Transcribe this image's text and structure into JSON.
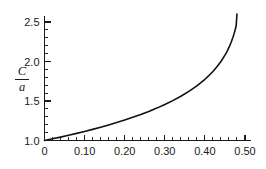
{
  "chart_data": {
    "type": "line",
    "title": "",
    "subtitle": "",
    "xlabel": "",
    "ylabel": "C/a",
    "ylabel_numerator": "C",
    "ylabel_denominator": "a",
    "xlim": [
      0,
      0.5
    ],
    "ylim": [
      1.0,
      2.6
    ],
    "grid": false,
    "legend": null,
    "legend_position": "none",
    "x_ticks_major": [
      0,
      0.1,
      0.2,
      0.3,
      0.4,
      0.5
    ],
    "x_tick_labels": [
      "0",
      "0.10",
      "0.20",
      "0.30",
      "0.40",
      "0.50"
    ],
    "x_tick_minor_step": 0.02,
    "y_ticks_major": [
      1.0,
      1.5,
      2.0,
      2.5
    ],
    "y_tick_labels": [
      "1.0",
      "1.5",
      "2.0",
      "2.5"
    ],
    "y_tick_minor_step": 0.1,
    "series": [
      {
        "name": "C/a",
        "color": "#111111",
        "x": [
          0.0,
          0.02,
          0.04,
          0.06,
          0.08,
          0.1,
          0.12,
          0.14,
          0.16,
          0.18,
          0.2,
          0.22,
          0.24,
          0.26,
          0.28,
          0.3,
          0.32,
          0.34,
          0.36,
          0.38,
          0.4,
          0.41,
          0.42,
          0.43,
          0.44,
          0.45,
          0.455,
          0.46,
          0.465,
          0.47,
          0.473,
          0.476,
          0.478,
          0.48
        ],
        "y": [
          1.0,
          1.021,
          1.043,
          1.066,
          1.09,
          1.115,
          1.141,
          1.168,
          1.197,
          1.227,
          1.259,
          1.293,
          1.329,
          1.368,
          1.41,
          1.455,
          1.505,
          1.56,
          1.622,
          1.692,
          1.775,
          1.822,
          1.874,
          1.933,
          2.0,
          2.08,
          2.126,
          2.178,
          2.238,
          2.308,
          2.356,
          2.412,
          2.456,
          2.6
        ]
      }
    ]
  },
  "axes": {
    "x_axis_name": "x-axis",
    "y_axis_name": "y-axis"
  }
}
